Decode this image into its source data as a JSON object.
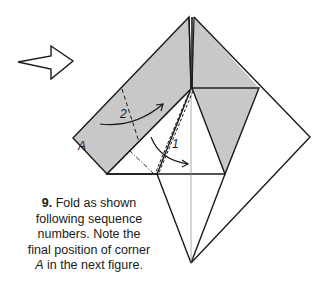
{
  "figure": {
    "step_number": "9.",
    "caption_line1": "Fold as shown",
    "caption_line2": "following sequence",
    "caption_line3": "numbers.  Note the",
    "caption_line4": "final position of corner",
    "caption_corner": "A",
    "caption_line5_rest": " in the next figure.",
    "labels": {
      "corner": "A",
      "fold_1": "1",
      "fold_2": "2"
    },
    "icons": {
      "turn_over_arrow": "outline-right-arrow-icon"
    },
    "colors": {
      "paper_colored_side": "#c8c8c8",
      "paper_white_side": "#ffffff",
      "line": "#1a1a1a",
      "thin_line": "#777777"
    }
  }
}
